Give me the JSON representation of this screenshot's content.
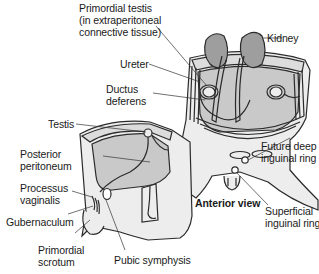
{
  "figure": {
    "view_label": "Anterior view",
    "labels": {
      "primordial_testis": "Primordial testis\n(in extraperitoneal\nconnective tissue)",
      "kidney": "Kidney",
      "ureter": "Ureter",
      "ductus_deferens": "Ductus\ndeferens",
      "testis": "Testis",
      "posterior_peritoneum": "Posterior\nperitoneum",
      "processus_vaginalis": "Processus\nvaginalis",
      "gubernaculum": "Gubernaculum",
      "primordial_scrotum": "Primordial\nscrotum",
      "pubic_symphysis": "Pubic symphysis",
      "future_deep_inguinal_ring": "Future deep\ninguinal ring",
      "superficial_inguinal_ring": "Superficial\ninguinal ring"
    },
    "colors": {
      "outline": "#2b2b2b",
      "body_fill": "#ededed",
      "cavity_fill": "#c9c9c9",
      "kidney_fill": "#9e9e9e",
      "wall_fill": "#dcdcdc",
      "leader": "#333333"
    }
  }
}
